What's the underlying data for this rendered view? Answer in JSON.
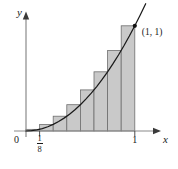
{
  "figure": {
    "title": "",
    "labels": {
      "y_axis": "y",
      "x_axis": "x",
      "origin": "0",
      "tick_one": "1",
      "fraction_numerator": "1",
      "fraction_denominator": "8",
      "point": "(1, 1)"
    },
    "colors": {
      "axis": "#4d4d4d",
      "curve": "#1a1a1a",
      "bar_fill": "#c9c9c9",
      "bar_stroke": "#6e6e6e",
      "text": "#1a1a1a",
      "background": "#ffffff"
    }
  },
  "chart_data": {
    "type": "area",
    "title": "",
    "subtitle": "",
    "xlabel": "x",
    "ylabel": "y",
    "xlim": [
      0,
      1.12
    ],
    "ylim": [
      0,
      1.25
    ],
    "grid": false,
    "legend": null,
    "function": "y = x^2",
    "curve": {
      "name": "y = x^2",
      "x": [
        0,
        0.05,
        0.1,
        0.15,
        0.2,
        0.25,
        0.3,
        0.35,
        0.4,
        0.45,
        0.5,
        0.55,
        0.6,
        0.65,
        0.7,
        0.75,
        0.8,
        0.85,
        0.9,
        0.95,
        1.0,
        1.05,
        1.1
      ],
      "y": [
        0,
        0.0025,
        0.01,
        0.0225,
        0.04,
        0.0625,
        0.09,
        0.1225,
        0.16,
        0.2025,
        0.25,
        0.3025,
        0.36,
        0.4225,
        0.49,
        0.5625,
        0.64,
        0.7225,
        0.81,
        0.9025,
        1.0,
        1.1025,
        1.21
      ]
    },
    "riemann_sum": {
      "method": "right endpoint",
      "n": 8,
      "interval": [
        0,
        1
      ],
      "width": 0.125,
      "rectangle_right_edges": [
        0.125,
        0.25,
        0.375,
        0.5,
        0.625,
        0.75,
        0.875,
        1.0
      ],
      "rectangle_heights": [
        0.015625,
        0.0625,
        0.140625,
        0.25,
        0.390625,
        0.5625,
        0.765625,
        1.0
      ]
    },
    "annotations": [
      {
        "label": "(1, 1)",
        "x": 1.0,
        "y": 1.0,
        "marker": "dot"
      }
    ],
    "xticks": [
      {
        "value": 0.125,
        "label": "1/8"
      },
      {
        "value": 1.0,
        "label": "1"
      }
    ],
    "yticks": [],
    "origin_label": "0"
  }
}
